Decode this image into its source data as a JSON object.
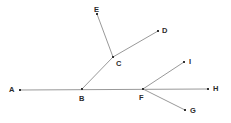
{
  "figure": {
    "type": "geometry-diagram",
    "width": 231,
    "height": 123,
    "background_color": "#ffffff",
    "line_color": "#999999",
    "line_width": 1,
    "marker_color": "#333333",
    "marker_size": 2,
    "label_color": "#2b2b2b"
  },
  "points": [
    {
      "id": "A",
      "label": "A",
      "x": 20,
      "y": 90,
      "label_x": 9,
      "label_y": 86
    },
    {
      "id": "B",
      "label": "B",
      "x": 82,
      "y": 89,
      "label_x": 79,
      "label_y": 95
    },
    {
      "id": "C",
      "label": "C",
      "x": 113,
      "y": 57,
      "label_x": 116,
      "label_y": 60
    },
    {
      "id": "D",
      "label": "D",
      "x": 158,
      "y": 31,
      "label_x": 162,
      "label_y": 27
    },
    {
      "id": "E",
      "label": "E",
      "x": 97,
      "y": 14,
      "label_x": 94,
      "label_y": 6
    },
    {
      "id": "F",
      "label": "F",
      "x": 143,
      "y": 89,
      "label_x": 139,
      "label_y": 94
    },
    {
      "id": "G",
      "label": "G",
      "x": 185,
      "y": 110,
      "label_x": 190,
      "label_y": 107
    },
    {
      "id": "H",
      "label": "H",
      "x": 208,
      "y": 89,
      "label_x": 213,
      "label_y": 85
    },
    {
      "id": "I",
      "label": "I",
      "x": 184,
      "y": 62,
      "label_x": 189,
      "label_y": 58
    }
  ],
  "segments": [
    {
      "id": "AH",
      "from": "A",
      "to": "H",
      "description": "horizontal-baseline-through-B-and-F"
    },
    {
      "id": "BC",
      "from": "B",
      "to": "C",
      "description": "ray-from-B-up-right-to-C"
    },
    {
      "id": "CE",
      "from": "C",
      "to": "E",
      "description": "ray-from-C-up-left-to-E"
    },
    {
      "id": "CD",
      "from": "C",
      "to": "D",
      "description": "ray-from-C-up-right-to-D"
    },
    {
      "id": "FI",
      "from": "F",
      "to": "I",
      "description": "ray-from-F-up-right-to-I"
    },
    {
      "id": "FG",
      "from": "F",
      "to": "G",
      "description": "ray-from-F-down-right-to-G"
    }
  ]
}
